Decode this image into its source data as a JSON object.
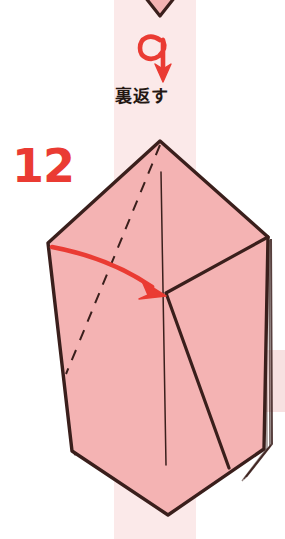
{
  "page": {
    "kind": "origami-instruction-diagram",
    "width": 285,
    "height": 539,
    "background_color": "#ffffff"
  },
  "step": {
    "number": "12",
    "number_color": "#ea3b33"
  },
  "instruction": {
    "label": "裏返す",
    "label_romaji_meaning": "turn over",
    "label_color": "#231612",
    "symbol_name": "turn-over-loop-arrow",
    "symbol_color": "#ea3b33"
  },
  "colors": {
    "paper_fill": "#f4b3b3",
    "paper_fill_light": "#f7c3c3",
    "paper_outline": "#3a1f1c",
    "crease_line": "#3a1f1c",
    "accent_red": "#ea3b33",
    "background_strip": "#fbe9e9",
    "background_block": "#f9e4e4"
  },
  "figure": {
    "name": "folded-paper-model",
    "apex": [
      160,
      141
    ],
    "left_vertex": [
      48,
      243
    ],
    "right_vertex": [
      268,
      237
    ],
    "bottom_tip": [
      168,
      515
    ],
    "previous_step_tip_name": "previous-figure-bottom-tip"
  },
  "annotations": {
    "fold_arrow_name": "fold-direction-arrow",
    "fold_arrow_color": "#ea3b33",
    "valley_crease_name": "dashed-valley-crease-line"
  }
}
